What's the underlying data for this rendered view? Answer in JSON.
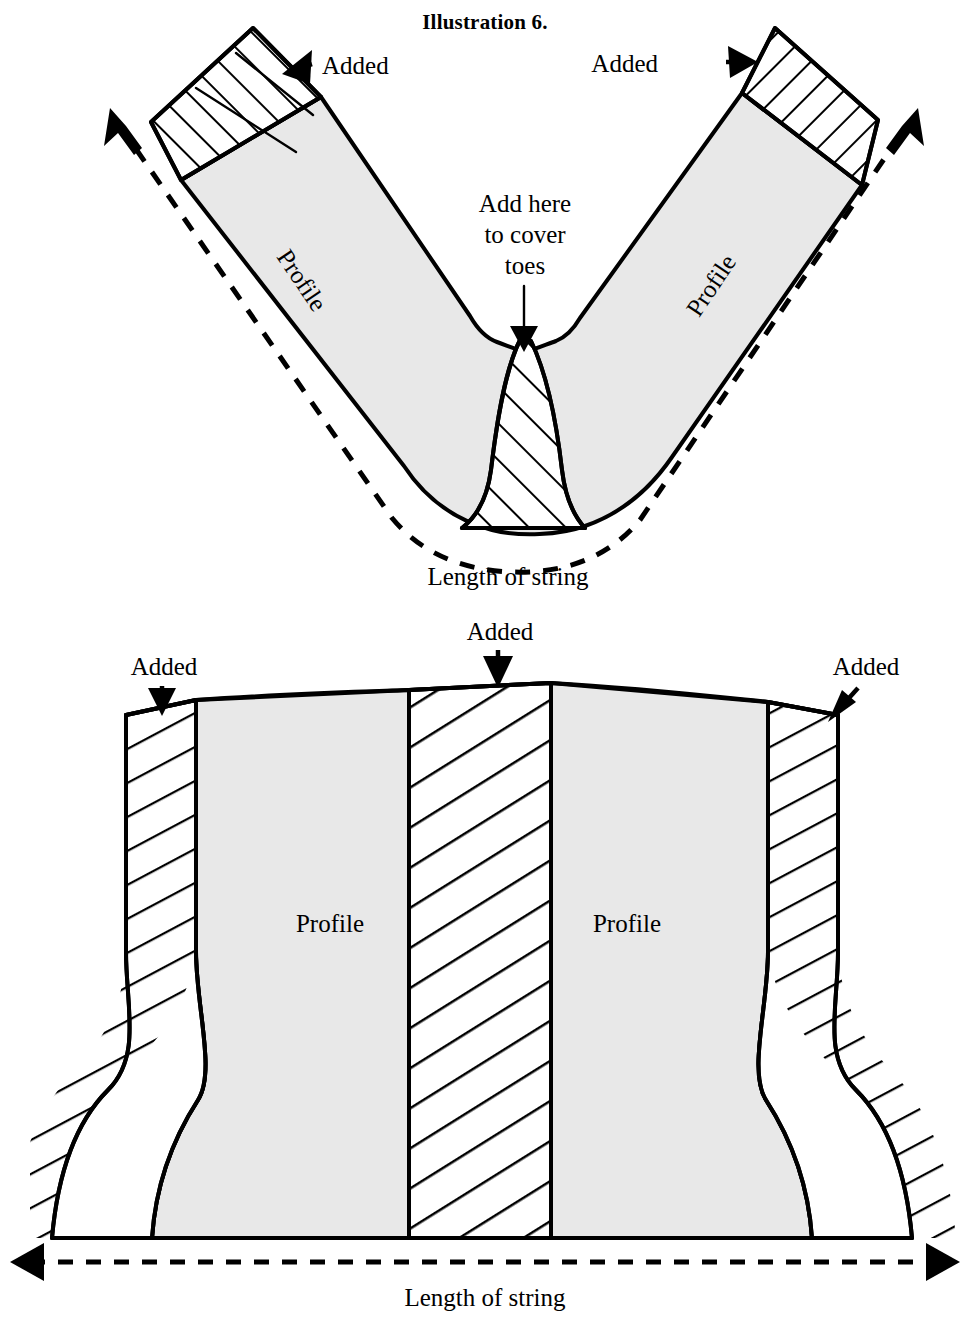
{
  "figure": {
    "title": "Illustration 6.",
    "colors": {
      "profile_fill": "#e8e8e8",
      "added_fill": "#ffffff",
      "ink": "#000000",
      "background": "#ffffff"
    }
  },
  "top_diagram": {
    "name": "v-shaped-sock-pattern",
    "labels": {
      "added_left": "Added",
      "added_right": "Added",
      "add_here_line1": "Add here",
      "add_here_line2": "to cover",
      "add_here_line3": "toes",
      "profile_left": "Profile",
      "profile_right": "Profile",
      "caption": "Length  of  string"
    }
  },
  "bottom_diagram": {
    "name": "flat-sock-pattern",
    "labels": {
      "added_left": "Added",
      "added_center": "Added",
      "added_right": "Added",
      "profile_left": "Profile",
      "profile_right": "Profile",
      "caption": "Length of string"
    }
  }
}
